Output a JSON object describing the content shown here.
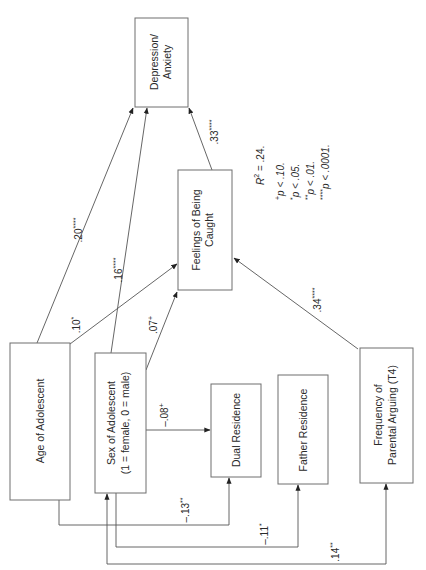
{
  "diagram": {
    "type": "path-diagram",
    "orientation": "rotated-90-ccw",
    "nodes": [
      {
        "id": "depression",
        "label_lines": [
          "Depression/",
          "Anxiety"
        ]
      },
      {
        "id": "caught",
        "label_lines": [
          "Feelings of Being",
          "Caught"
        ]
      },
      {
        "id": "age",
        "label_lines": [
          "Age of Adolescent"
        ]
      },
      {
        "id": "sex",
        "label_lines": [
          "Sex of Adolescent",
          "(1 = female, 0 = male)"
        ]
      },
      {
        "id": "dual",
        "label_lines": [
          "Dual Residence"
        ]
      },
      {
        "id": "father",
        "label_lines": [
          "Father Residence"
        ]
      },
      {
        "id": "arguing",
        "label_lines": [
          "Frequency of",
          "Parental Arguing (T4)"
        ]
      }
    ],
    "edges": [
      {
        "from": "age",
        "to": "depression",
        "coef": ".20",
        "sig": "****"
      },
      {
        "from": "sex",
        "to": "depression",
        "coef": ".16",
        "sig": "****"
      },
      {
        "from": "caught",
        "to": "depression",
        "coef": ".33",
        "sig": "****"
      },
      {
        "from": "age",
        "to": "caught",
        "coef": ".10",
        "sig": "*"
      },
      {
        "from": "sex",
        "to": "caught",
        "coef": ".07",
        "sig": "+"
      },
      {
        "from": "arguing",
        "to": "caught",
        "coef": ".34",
        "sig": "****"
      },
      {
        "from": "sex",
        "to": "dual",
        "coef": "–.08",
        "sig": "+"
      },
      {
        "from": "age",
        "to": "dual",
        "coef": "–.13",
        "sig": "**"
      },
      {
        "from": "sex",
        "to": "father",
        "coef": "–.11",
        "sig": "*"
      },
      {
        "from": "sex",
        "to": "arguing",
        "coef": ".14",
        "sig": "**",
        "bidirectional": true
      }
    ],
    "legend": {
      "r2_label": "R",
      "r2_exp": "2",
      "r2_value": " = .24.",
      "items": [
        {
          "sym": "+",
          "text": "p  <  .10."
        },
        {
          "sym": "*",
          "text": "p  <  .05."
        },
        {
          "sym": "**",
          "text": "p  <  .01."
        },
        {
          "sym": "****",
          "text": "p  <  .0001."
        }
      ]
    }
  }
}
